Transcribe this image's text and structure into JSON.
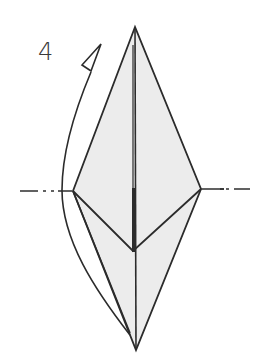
{
  "diagram": {
    "step_number": "4",
    "colors": {
      "paper_fill": "#ececec",
      "line": "#2b2b2b",
      "background": "#ffffff"
    },
    "shapes": {
      "outer_diamond": {
        "top": [
          135,
          27
        ],
        "left": [
          73,
          191
        ],
        "right": [
          201,
          189
        ],
        "bottom": [
          136,
          350
        ]
      },
      "inner_v_bottom": [
        133,
        251
      ],
      "fold_line_left": {
        "from": [
          20,
          191
        ],
        "to": [
          70,
          191
        ]
      },
      "fold_line_right": {
        "from": [
          205,
          189
        ],
        "to": [
          250,
          189
        ]
      }
    },
    "arrow": {
      "type": "fold-behind arrow",
      "icon": "hollow-triangle-arrowhead"
    }
  }
}
